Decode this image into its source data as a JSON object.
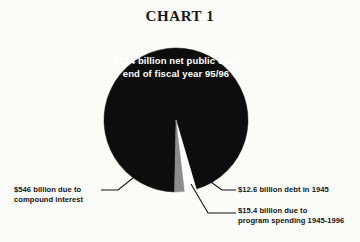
{
  "chart_data": {
    "type": "pie",
    "title": "CHART 1",
    "center_label": "$574 billion\nnet public debt\nend of fiscal year 95/96",
    "center_label_lines": [
      "$574 billion",
      "net public debt",
      "end of fiscal year 95/96"
    ],
    "total": 574,
    "units": "billion dollars",
    "legend_position": "callouts",
    "grid": false,
    "categories": [
      "$546 billion due to compound interest",
      "$15.4 billion due to program spending 1945-1996",
      "$12.6 billion debt in 1945"
    ],
    "values": [
      546,
      15.4,
      12.6
    ],
    "percentages": [
      95.1,
      2.7,
      2.2
    ],
    "colors": [
      "#0d0d0d",
      "#ffffff",
      "#8c8c8c"
    ],
    "slices": [
      {
        "label": "$546 billion due to compound interest",
        "value": 546,
        "percent": 95.1,
        "color": "#0d0d0d"
      },
      {
        "label": "$15.4 billion due to program spending 1945-1996",
        "value": 15.4,
        "percent": 2.7,
        "color": "#ffffff"
      },
      {
        "label": "$12.6 billion debt in 1945",
        "value": 12.6,
        "percent": 2.2,
        "color": "#8c8c8c"
      }
    ],
    "annotations": [
      {
        "name": "compound-interest",
        "text": "$546 billion due to\ncompound interest"
      },
      {
        "name": "debt-1945",
        "text": "$12.6 billion debt in 1945"
      },
      {
        "name": "program-spending",
        "text": "$15.4 billion due to\nprogram spending 1945-1996"
      }
    ]
  },
  "callouts": {
    "compound_interest": "$546 billion due to\ncompound interest",
    "debt_1945": "$12.6 billion debt in 1945",
    "program_spending": "$15.4 billion due to\nprogram spending 1945-1996"
  }
}
